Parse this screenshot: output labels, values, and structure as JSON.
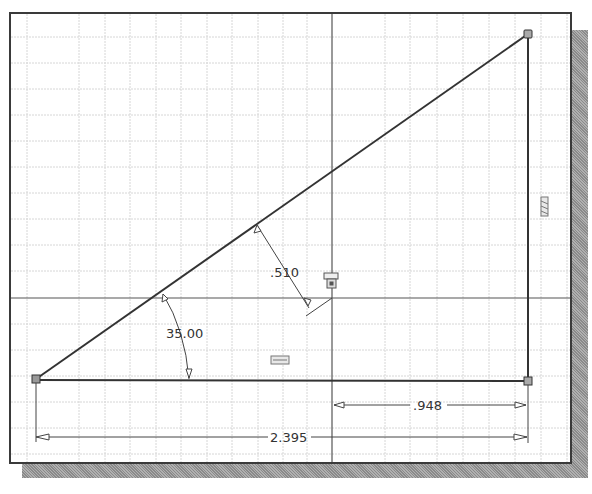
{
  "sketch": {
    "title": "2D sketch with triangle and dimensions",
    "colors": {
      "background": "#ffffff",
      "frame": "#3a3a3a",
      "grid": "#d8d8d8",
      "axis": "#555555",
      "geometry": "#333333",
      "dimension": "#444444",
      "shadow": "#9a9a9a"
    },
    "dimensions": {
      "offset": ".510",
      "angle": "35.00",
      "short_horizontal": ".948",
      "overall_horizontal": "2.395"
    },
    "constraint_icons": [
      {
        "name": "parallel-constraint-icon",
        "position": "right-vertical-line"
      },
      {
        "name": "horizontal-constraint-icon",
        "position": "bottom-line"
      },
      {
        "name": "fix-constraint-icon",
        "position": "origin"
      }
    ],
    "vertices": [
      {
        "name": "vertex-bottom-left",
        "x": 36,
        "y": 379
      },
      {
        "name": "vertex-top-right",
        "x": 528,
        "y": 34
      },
      {
        "name": "vertex-bottom-right",
        "x": 528,
        "y": 381
      }
    ]
  }
}
